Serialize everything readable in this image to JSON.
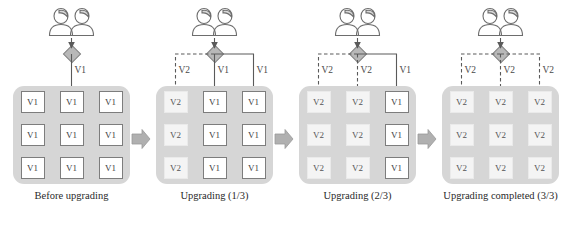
{
  "figure": {
    "type": "rolling-upgrade-sequence",
    "version_old": "V1",
    "version_new": "V2"
  },
  "style": {
    "pool_fill": "#d6d6d6",
    "node_v1_fill": "#ffffff",
    "node_v1_border": "#7d7d7d",
    "node_v2_fill": "#f4f4f4",
    "router_fill": "#b8b8b8",
    "step_arrow_fill": "#b0b0b0",
    "line_color": "#5a5a5a",
    "text_color": "#2a2a2a"
  },
  "icons": {
    "users": "users-icon",
    "router": "load-balancer-diamond-icon",
    "step_arrow": "step-arrow-right-icon"
  },
  "panels": [
    {
      "id": "panel-before",
      "caption": "Before upgrading",
      "routes": [
        {
          "target_column": 1,
          "label": "V1",
          "style": "solid",
          "visible": false
        },
        {
          "target_column": 2,
          "label": "V1",
          "style": "solid",
          "visible": true
        },
        {
          "target_column": 3,
          "label": "V1",
          "style": "solid",
          "visible": false
        }
      ],
      "grid": [
        [
          "V1",
          "V1",
          "V1"
        ],
        [
          "V1",
          "V1",
          "V1"
        ],
        [
          "V1",
          "V1",
          "V1"
        ]
      ]
    },
    {
      "id": "panel-upgrading-1",
      "caption": "Upgrading (1/3)",
      "routes": [
        {
          "target_column": 1,
          "label": "V2",
          "style": "dashed",
          "visible": true
        },
        {
          "target_column": 2,
          "label": "V1",
          "style": "solid",
          "visible": true
        },
        {
          "target_column": 3,
          "label": "V1",
          "style": "solid",
          "visible": true
        }
      ],
      "grid": [
        [
          "V2",
          "V1",
          "V1"
        ],
        [
          "V2",
          "V1",
          "V1"
        ],
        [
          "V2",
          "V1",
          "V1"
        ]
      ]
    },
    {
      "id": "panel-upgrading-2",
      "caption": "Upgrading (2/3)",
      "routes": [
        {
          "target_column": 1,
          "label": "V2",
          "style": "dashed",
          "visible": true
        },
        {
          "target_column": 2,
          "label": "V2",
          "style": "dashed",
          "visible": true
        },
        {
          "target_column": 3,
          "label": "V1",
          "style": "solid",
          "visible": true
        }
      ],
      "grid": [
        [
          "V2",
          "V2",
          "V1"
        ],
        [
          "V2",
          "V2",
          "V1"
        ],
        [
          "V2",
          "V2",
          "V1"
        ]
      ]
    },
    {
      "id": "panel-completed",
      "caption": "Upgrading completed (3/3)",
      "routes": [
        {
          "target_column": 1,
          "label": "V2",
          "style": "dashed",
          "visible": true
        },
        {
          "target_column": 2,
          "label": "V2",
          "style": "dashed",
          "visible": true
        },
        {
          "target_column": 3,
          "label": "V2",
          "style": "dashed",
          "visible": true
        }
      ],
      "grid": [
        [
          "V2",
          "V2",
          "V2"
        ],
        [
          "V2",
          "V2",
          "V2"
        ],
        [
          "V2",
          "V2",
          "V2"
        ]
      ]
    }
  ],
  "step_arrows": [
    {
      "id": "step-arrow-1",
      "after_panel": "panel-before"
    },
    {
      "id": "step-arrow-2",
      "after_panel": "panel-upgrading-1"
    },
    {
      "id": "step-arrow-3",
      "after_panel": "panel-upgrading-2"
    }
  ]
}
